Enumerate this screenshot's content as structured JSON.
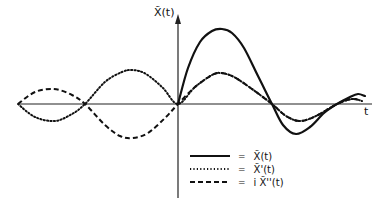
{
  "chart_data": {
    "type": "line",
    "title": "",
    "xlabel": "t",
    "ylabel": "X̃(t)",
    "grid": false,
    "legend_position": "lower-right",
    "axes": {
      "origin_px": [
        178,
        104
      ],
      "x_range_px": [
        18,
        372
      ],
      "y_range_px": [
        14,
        198
      ]
    },
    "series": [
      {
        "name": "X̃(t)",
        "style": "solid",
        "points_px": [
          [
            178,
            104
          ],
          [
            188,
            68
          ],
          [
            200,
            42
          ],
          [
            212,
            31
          ],
          [
            222,
            29
          ],
          [
            232,
            33
          ],
          [
            244,
            48
          ],
          [
            258,
            76
          ],
          [
            272,
            104
          ],
          [
            283,
            125
          ],
          [
            296,
            134
          ],
          [
            310,
            127
          ],
          [
            324,
            113
          ],
          [
            337,
            104
          ],
          [
            350,
            97
          ],
          [
            358,
            94
          ],
          [
            365,
            96
          ]
        ]
      },
      {
        "name": "X̃'(t)",
        "style": "dotted",
        "points_px": [
          [
            18,
            104
          ],
          [
            35,
            117
          ],
          [
            55,
            121
          ],
          [
            72,
            114
          ],
          [
            85,
            104
          ],
          [
            105,
            82
          ],
          [
            122,
            72
          ],
          [
            133,
            70
          ],
          [
            146,
            74
          ],
          [
            163,
            88
          ],
          [
            178,
            104
          ],
          [
            195,
            87
          ],
          [
            212,
            75
          ],
          [
            221,
            73
          ],
          [
            234,
            77
          ],
          [
            252,
            89
          ],
          [
            272,
            104
          ],
          [
            286,
            116
          ],
          [
            300,
            121
          ],
          [
            316,
            116
          ],
          [
            337,
            104
          ],
          [
            352,
            99
          ],
          [
            362,
            101
          ]
        ]
      },
      {
        "name": "i X̃''(t)",
        "style": "dashed",
        "points_px": [
          [
            18,
            104
          ],
          [
            35,
            92
          ],
          [
            54,
            89
          ],
          [
            72,
            95
          ],
          [
            85,
            104
          ],
          [
            105,
            125
          ],
          [
            120,
            136
          ],
          [
            133,
            138
          ],
          [
            148,
            133
          ],
          [
            165,
            118
          ],
          [
            178,
            104
          ],
          [
            195,
            87
          ],
          [
            212,
            75
          ],
          [
            221,
            73
          ],
          [
            234,
            77
          ],
          [
            252,
            89
          ],
          [
            272,
            104
          ],
          [
            286,
            116
          ],
          [
            300,
            121
          ],
          [
            316,
            116
          ],
          [
            337,
            104
          ],
          [
            352,
            99
          ],
          [
            362,
            101
          ]
        ]
      }
    ],
    "annotations": [
      "X̃(t)",
      "t"
    ]
  },
  "labels": {
    "y_axis": "X̃(t)",
    "x_axis": "t"
  },
  "legend": [
    {
      "style": "solid",
      "eq": "=",
      "label": "X̃(t)"
    },
    {
      "style": "dotted",
      "eq": "=",
      "label": "X̃'(t)"
    },
    {
      "style": "dashed",
      "eq": "=",
      "label": "i X̃''(t)"
    }
  ],
  "colors": {
    "line": "#111111",
    "background": "#ffffff"
  }
}
